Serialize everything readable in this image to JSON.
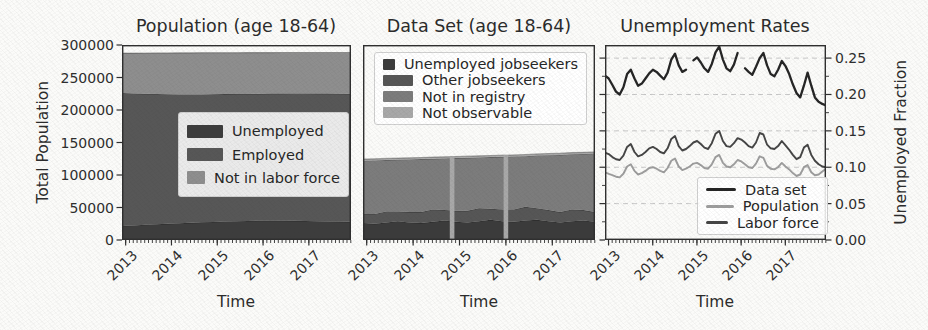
{
  "figure": {
    "background": "#fbfbf9",
    "text_color": "#262626",
    "spine_color": "#2f2f2f",
    "grid_color": "#c8c8c8",
    "edge_line_color": "rgba(0,0,0,0.28)"
  },
  "chart_data": [
    {
      "id": "population",
      "type": "area",
      "title": "Population (age 18-64)",
      "xlabel": "Time",
      "ylabel": "Total Population",
      "ylabel_side": "left",
      "xlim": [
        2012.92,
        2017.92
      ],
      "ylim": [
        0,
        300000
      ],
      "x_tick_labels": [
        "2013",
        "2014",
        "2015",
        "2016",
        "2017"
      ],
      "x_tick_values": [
        2013,
        2014,
        2015,
        2016,
        2017
      ],
      "x_minor_step": 0.0833333,
      "y_tick_labels": [
        "0",
        "50000",
        "100000",
        "150000",
        "200000",
        "250000",
        "300000"
      ],
      "y_tick_values": [
        0,
        50000,
        100000,
        150000,
        200000,
        250000,
        300000
      ],
      "y_tick_marks": [
        "left"
      ],
      "y_tick_labels_side": "left",
      "grid_values": [],
      "x_start": 2012.92,
      "x_step": 0.25,
      "series": [
        {
          "name": "Unemployed",
          "color": "#3d3d3d",
          "values": [
            21500,
            22500,
            23500,
            24300,
            25000,
            25800,
            26500,
            27200,
            27800,
            28400,
            29000,
            29400,
            29700,
            29800,
            29700,
            29500,
            29200,
            28900,
            28600,
            28300,
            28000
          ]
        },
        {
          "name": "Employed",
          "color": "#575757",
          "values": [
            204500,
            203000,
            201500,
            200300,
            199300,
            198200,
            197500,
            196800,
            196400,
            196000,
            195600,
            195400,
            195300,
            195400,
            195600,
            195900,
            196200,
            196400,
            196600,
            196800,
            197000
          ]
        },
        {
          "name": "Not in labor force",
          "color": "#8e8e8e",
          "values": [
            61500,
            62100,
            62700,
            63200,
            63600,
            64000,
            64000,
            64100,
            63900,
            63800,
            63600,
            63500,
            63300,
            63100,
            63100,
            63000,
            63000,
            63200,
            63300,
            63400,
            63500
          ]
        }
      ],
      "legend": {
        "position": "center right",
        "box": {
          "x": 178,
          "y": 112,
          "w": 171,
          "h": 85
        },
        "swatch": "patch",
        "swatch_w": 36,
        "swatch_h": 13,
        "items": [
          {
            "label": "Unemployed",
            "color": "#3d3d3d"
          },
          {
            "label": "Employed",
            "color": "#575757"
          },
          {
            "label": "Not in labor force",
            "color": "#8e8e8e"
          }
        ]
      }
    },
    {
      "id": "dataset",
      "type": "area",
      "title": "Data Set (age 18-64)",
      "xlabel": "Time",
      "ylabel": "",
      "ylabel_side": null,
      "xlim": [
        2012.92,
        2017.92
      ],
      "ylim": [
        0,
        300000
      ],
      "x_tick_labels": [
        "2013",
        "2014",
        "2015",
        "2016",
        "2017"
      ],
      "x_tick_values": [
        2013,
        2014,
        2015,
        2016,
        2017
      ],
      "x_minor_step": 0.0833333,
      "y_tick_labels": [],
      "y_tick_values": [],
      "y_tick_marks": [],
      "y_tick_labels_side": null,
      "grid_values": [],
      "x_start": 2012.92,
      "x_step": 0.25,
      "series": [
        {
          "name": "Unemployed jobseekers",
          "color": "#3b3b3b",
          "values": [
            26000,
            25000,
            27000,
            29000,
            27000,
            26000,
            28000,
            30000,
            28000,
            27000,
            29000,
            31000,
            29000,
            28000,
            30000,
            31000,
            29000,
            27000,
            29000,
            30000,
            28000
          ]
        },
        {
          "name": "Other jobseekers",
          "color": "#565656",
          "values": [
            14000,
            15000,
            17000,
            15000,
            16000,
            17000,
            19000,
            16000,
            17000,
            18000,
            20000,
            17000,
            18000,
            19000,
            21000,
            18000,
            17000,
            16000,
            18000,
            16000,
            15000
          ]
        },
        {
          "name": "Not in registry",
          "color": "#7c7c7c",
          "values": [
            82000,
            82500,
            79000,
            79500,
            81000,
            81500,
            78000,
            79500,
            81000,
            81500,
            78000,
            79500,
            81000,
            81500,
            78000,
            81000,
            84500,
            88000,
            85000,
            86500,
            90000
          ]
        },
        {
          "name": "Not observable",
          "color": "#a8a8a8",
          "values": [
            2500,
            2500,
            2500,
            2500,
            2500,
            2500,
            2500,
            2500,
            2500,
            2500,
            2500,
            2500,
            2500,
            2500,
            2500,
            2500,
            2500,
            2500,
            2500,
            2500,
            2500
          ]
        }
      ],
      "stripes": {
        "x_values": [
          2014.84,
          2016.0
        ],
        "width_years": 0.1,
        "color": "#a8a8a8"
      },
      "legend": {
        "position": "upper left",
        "box": {
          "x": 374,
          "y": 52,
          "w": 213,
          "h": 73
        },
        "swatch": "patch",
        "swatch_w": 30,
        "swatch_h": 11,
        "items": [
          {
            "label": "Unemployed jobseekers",
            "color": "#3b3b3b"
          },
          {
            "label": "Other jobseekers",
            "color": "#565656"
          },
          {
            "label": "Not in registry",
            "color": "#7c7c7c"
          },
          {
            "label": "Not observable",
            "color": "#a8a8a8"
          }
        ]
      }
    },
    {
      "id": "rates",
      "type": "line",
      "title": "Unemployment Rates",
      "xlabel": "Time",
      "ylabel": "Unemployed Fraction",
      "ylabel_side": "right",
      "xlim": [
        2012.92,
        2017.92
      ],
      "ylim": [
        0,
        0.268
      ],
      "x_tick_labels": [
        "2013",
        "2014",
        "2015",
        "2016",
        "2017"
      ],
      "x_tick_values": [
        2013,
        2014,
        2015,
        2016,
        2017
      ],
      "x_minor_step": 0.0833333,
      "y_tick_labels": [
        "0.00",
        "0.05",
        "0.10",
        "0.15",
        "0.20",
        "0.25"
      ],
      "y_tick_values": [
        0,
        0.05,
        0.1,
        0.15,
        0.2,
        0.25
      ],
      "y_minor_step": 0.025,
      "y_tick_marks": [
        "left",
        "right"
      ],
      "y_tick_labels_side": "right",
      "grid_values": [
        0.05,
        0.1,
        0.15,
        0.2,
        0.25
      ],
      "grid_style": "dashed",
      "x_start": 2012.92,
      "x_step": 0.0833333,
      "draw_order": [
        1,
        2,
        0
      ],
      "series": [
        {
          "name": "Data set",
          "color": "#252525",
          "width": 2.3,
          "values": [
            0.226,
            0.222,
            0.213,
            0.204,
            0.2,
            0.21,
            0.228,
            0.234,
            0.222,
            0.212,
            0.215,
            0.222,
            0.229,
            0.234,
            0.231,
            0.226,
            0.221,
            0.23,
            0.248,
            0.256,
            0.24,
            0.231,
            0.234,
            null,
            0.247,
            0.251,
            0.244,
            0.236,
            0.231,
            0.242,
            0.258,
            0.266,
            0.248,
            0.236,
            0.232,
            0.241,
            0.257,
            null,
            0.236,
            0.231,
            0.227,
            0.238,
            0.25,
            0.257,
            0.24,
            0.228,
            0.225,
            0.234,
            0.246,
            0.239,
            0.228,
            0.214,
            0.202,
            0.196,
            0.212,
            0.23,
            0.212,
            0.196,
            0.19,
            0.187,
            0.185
          ]
        },
        {
          "name": "Population",
          "color": "#9d9d9d",
          "width": 1.9,
          "values": [
            0.093,
            0.091,
            0.089,
            0.087,
            0.086,
            0.091,
            0.101,
            0.104,
            0.095,
            0.09,
            0.092,
            0.095,
            0.099,
            0.1,
            0.098,
            0.095,
            0.093,
            0.099,
            0.109,
            0.112,
            0.101,
            0.096,
            0.098,
            0.101,
            0.105,
            0.106,
            0.103,
            0.099,
            0.098,
            0.104,
            0.114,
            0.117,
            0.106,
            0.101,
            0.1,
            0.104,
            0.11,
            0.108,
            0.104,
            0.1,
            0.099,
            0.105,
            0.115,
            0.113,
            0.102,
            0.098,
            0.097,
            0.1,
            0.106,
            0.101,
            0.097,
            0.092,
            0.088,
            0.09,
            0.1,
            0.103,
            0.093,
            0.089,
            0.09,
            0.094,
            0.098
          ]
        },
        {
          "name": "Labor force",
          "color": "#454545",
          "width": 1.9,
          "values": [
            0.12,
            0.118,
            0.114,
            0.111,
            0.11,
            0.116,
            0.128,
            0.132,
            0.121,
            0.115,
            0.117,
            0.121,
            0.126,
            0.128,
            0.125,
            0.121,
            0.119,
            0.126,
            0.139,
            0.143,
            0.129,
            0.123,
            0.125,
            0.129,
            0.134,
            0.136,
            0.132,
            0.127,
            0.125,
            0.133,
            0.146,
            0.15,
            0.136,
            0.129,
            0.128,
            0.133,
            0.14,
            0.138,
            0.134,
            0.129,
            0.127,
            0.134,
            0.147,
            0.145,
            0.131,
            0.126,
            0.125,
            0.129,
            0.136,
            0.13,
            0.124,
            0.117,
            0.111,
            0.114,
            0.127,
            0.131,
            0.117,
            0.109,
            0.104,
            0.101,
            0.1
          ]
        }
      ],
      "legend": {
        "position": "lower right",
        "box": {
          "x": 697,
          "y": 177,
          "w": 131,
          "h": 58
        },
        "swatch": "line",
        "swatch_w": 30,
        "swatch_h": 3,
        "items": [
          {
            "label": "Data set",
            "color": "#252525"
          },
          {
            "label": "Population",
            "color": "#9d9d9d"
          },
          {
            "label": "Labor force",
            "color": "#454545"
          }
        ]
      }
    }
  ]
}
